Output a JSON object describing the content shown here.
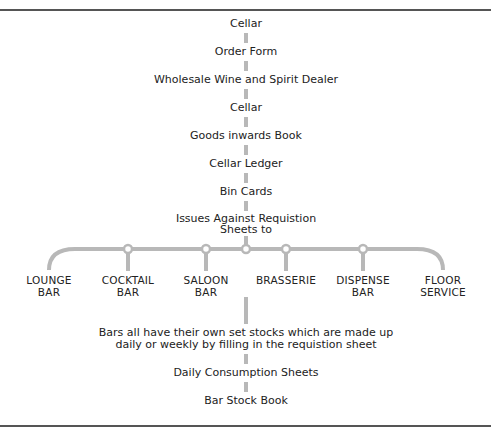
{
  "diagram": {
    "colors": {
      "connector": "#b8b8b8",
      "rule": "#555555",
      "text": "#222222"
    },
    "upper_chain": [
      {
        "label": "Cellar"
      },
      {
        "label": "Order Form"
      },
      {
        "label": "Wholesale Wine and Spirit Dealer"
      },
      {
        "label": "Cellar"
      },
      {
        "label": "Goods inwards Book"
      },
      {
        "label": "Cellar Ledger"
      },
      {
        "label": "Bin Cards"
      },
      {
        "label": "Issues Against Requistion",
        "label2": "Sheets to"
      }
    ],
    "branches": [
      {
        "line1": "LOUNGE",
        "line2": "BAR"
      },
      {
        "line1": "COCKTAIL",
        "line2": "BAR"
      },
      {
        "line1": "SALOON",
        "line2": "BAR"
      },
      {
        "line1": "BRASSERIE",
        "line2": ""
      },
      {
        "line1": "DISPENSE",
        "line2": "BAR"
      },
      {
        "line1": "FLOOR",
        "line2": "SERVICE"
      }
    ],
    "lower_chain": [
      {
        "label": "Bars all have their own set stocks which are made up",
        "label2": "daily or weekly by filling in the requistion sheet"
      },
      {
        "label": "Daily Consumption Sheets"
      },
      {
        "label": "Bar Stock Book"
      }
    ]
  }
}
